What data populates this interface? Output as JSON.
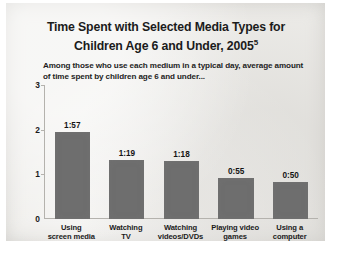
{
  "chart_data": {
    "type": "bar",
    "title": "Time Spent with Selected Media Types for Children Age 6 and Under, 2005",
    "title_line1": "Time Spent with Selected Media Types for",
    "title_line2": "Children Age 6 and Under, 2005",
    "title_footnote_marker": "5",
    "subtitle": "Among those who use each medium in a typical day, average amount of time spent by children age 6 and under...",
    "categories": [
      "Using screen media",
      "Watching TV",
      "Watching videos/DVDs",
      "Playing video games",
      "Using a computer"
    ],
    "category_lines": [
      [
        "Using",
        "screen media"
      ],
      [
        "Watching",
        "TV"
      ],
      [
        "Watching",
        "videos/DVDs"
      ],
      [
        "Playing video",
        "games"
      ],
      [
        "Using a",
        "computer"
      ]
    ],
    "value_labels": [
      "1:57",
      "1:19",
      "1:18",
      "0:55",
      "0:50"
    ],
    "values": [
      1.95,
      1.317,
      1.3,
      0.917,
      0.833
    ],
    "xlabel": "",
    "ylabel": "",
    "ylim": [
      0,
      3
    ],
    "yticks": [
      "0",
      "1",
      "2",
      "3"
    ],
    "ytick_values": [
      0,
      1,
      2,
      3
    ],
    "grid": false,
    "legend": false,
    "bar_color": "#6e6e6e",
    "background_color": "#eeedea",
    "text_color": "#1b1b1b",
    "axis_color": "#b4b2ad"
  }
}
